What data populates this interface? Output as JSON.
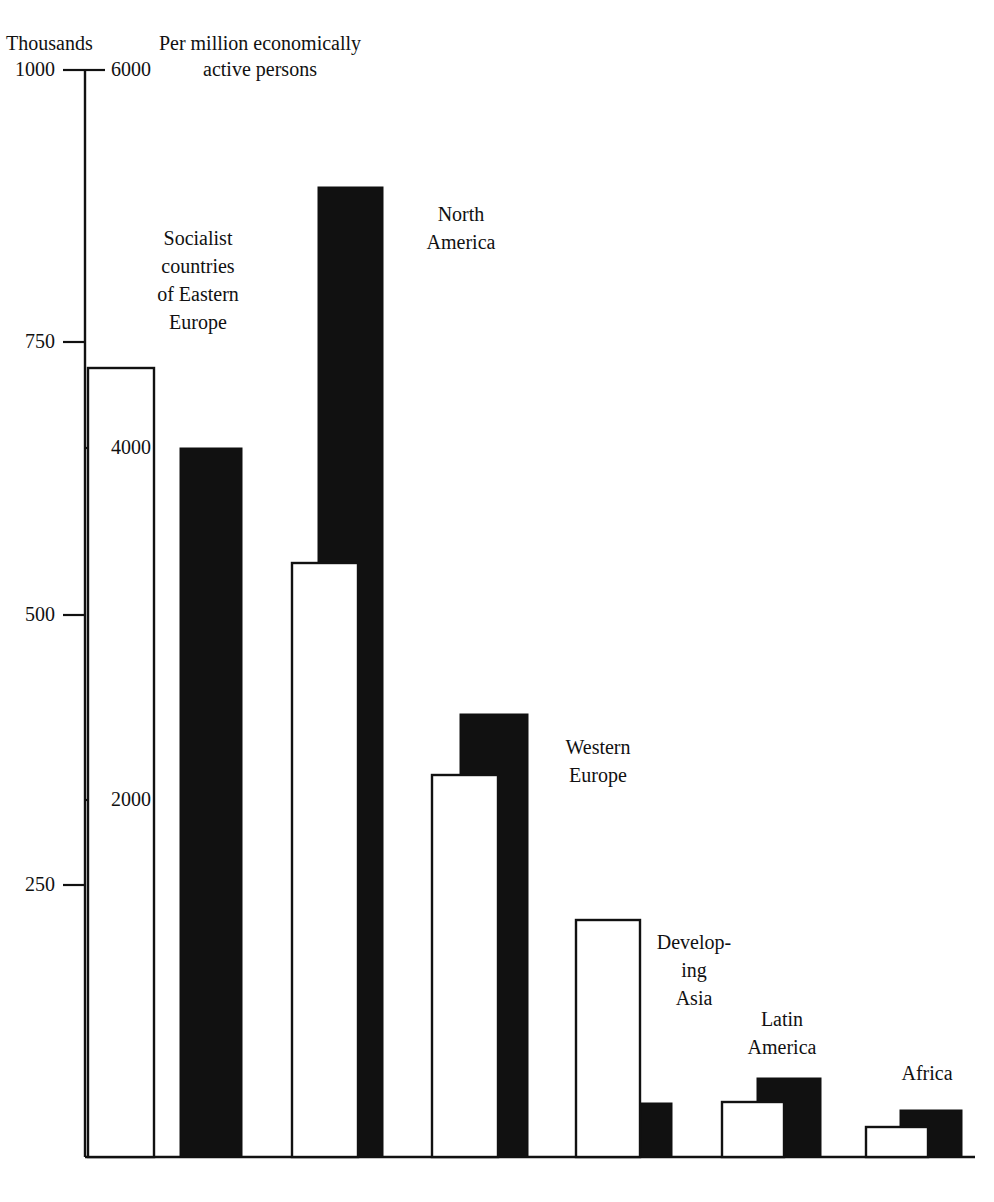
{
  "figure": {
    "left_axis_title": "Thousands",
    "right_axis_title": "Per million economically active persons",
    "background_color": "#ffffff",
    "ink_color": "#111111",
    "bar_white_fill": "#ffffff",
    "bar_black_fill": "#111111"
  },
  "axes": {
    "left_ticks": [
      {
        "label": "1000",
        "value": 1000,
        "y": 70
      },
      {
        "label": "750",
        "value": 750,
        "y": 342
      },
      {
        "label": "500",
        "value": 500,
        "y": 615
      },
      {
        "label": "250",
        "value": 250,
        "y": 885
      }
    ],
    "right_ticks": [
      {
        "label": "6000",
        "value": 6000,
        "y": 70
      },
      {
        "label": "4000",
        "value": 4000,
        "y": 448
      },
      {
        "label": "2000",
        "value": 2000,
        "y": 800
      }
    ],
    "baseline_y": 1157,
    "axis_x": 85,
    "axis_top_y": 70
  },
  "chart_data": {
    "type": "bar",
    "title": "",
    "subtitle": "",
    "xlabel": "",
    "ylabel": "Thousands",
    "ylabel_secondary": "Per million economically active persons",
    "ylim": [
      0,
      1000
    ],
    "ylim_secondary": [
      0,
      6000
    ],
    "grid": false,
    "legend_position": "none",
    "categories": [
      "Socialist countries of Eastern Europe",
      "North America",
      "Western Europe",
      "Developing Asia",
      "Latin America",
      "Africa"
    ],
    "series": [
      {
        "name": "Thousands",
        "style": "white",
        "units": "thousands of persons",
        "values": [
          725,
          545,
          350,
          218,
          51,
          28
        ]
      },
      {
        "name": "Per million economically active persons",
        "style": "black",
        "units": "per million economically active persons",
        "values": [
          4000,
          5730,
          2500,
          310,
          450,
          250
        ]
      }
    ]
  },
  "bars": [
    {
      "group": "Socialist countries of Eastern Europe",
      "label_lines": [
        "Socialist",
        "countries",
        "of Eastern",
        "Europe"
      ],
      "label_x": 118,
      "label_y": 224,
      "label_w": 160,
      "white": {
        "x": 88,
        "width": 66,
        "top_y": 368,
        "value": 725
      },
      "black": {
        "x": 180,
        "width": 62,
        "top_y": 448,
        "value": 4000
      }
    },
    {
      "group": "North America",
      "label_lines": [
        "North",
        "America"
      ],
      "label_x": 396,
      "label_y": 200,
      "label_w": 130,
      "white": {
        "x": 292,
        "width": 66,
        "top_y": 563,
        "value": 545
      },
      "black": {
        "x": 318,
        "width": 65,
        "top_y": 187,
        "value": 5730
      }
    },
    {
      "group": "Western Europe",
      "label_lines": [
        "Western",
        "Europe"
      ],
      "label_x": 528,
      "label_y": 733,
      "label_w": 140,
      "white": {
        "x": 432,
        "width": 66,
        "top_y": 775,
        "value": 350
      },
      "black": {
        "x": 460,
        "width": 68,
        "top_y": 714,
        "value": 2500
      }
    },
    {
      "group": "Developing Asia",
      "label_lines": [
        "Develop-",
        "ing",
        "Asia"
      ],
      "label_x": 634,
      "label_y": 928,
      "label_w": 120,
      "white": {
        "x": 576,
        "width": 64,
        "top_y": 920,
        "value": 218
      },
      "black": {
        "x": 608,
        "width": 64,
        "top_y": 1103,
        "value": 310
      }
    },
    {
      "group": "Latin America",
      "label_lines": [
        "Latin",
        "America"
      ],
      "label_x": 716,
      "label_y": 1005,
      "label_w": 132,
      "white": {
        "x": 722,
        "width": 62,
        "top_y": 1102,
        "value": 51
      },
      "black": {
        "x": 757,
        "width": 64,
        "top_y": 1078,
        "value": 450
      }
    },
    {
      "group": "Africa",
      "label_lines": [
        "Africa"
      ],
      "label_x": 872,
      "label_y": 1059,
      "label_w": 110,
      "white": {
        "x": 866,
        "width": 62,
        "top_y": 1127,
        "value": 28
      },
      "black": {
        "x": 900,
        "width": 62,
        "top_y": 1110,
        "value": 250
      }
    }
  ]
}
